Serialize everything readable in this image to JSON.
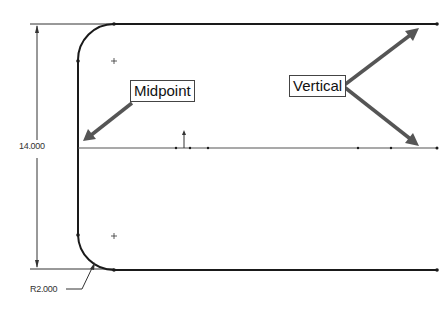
{
  "sketch": {
    "dimensions": {
      "height": "14.000",
      "radius": "R2.000"
    },
    "callouts": [
      {
        "label": "Midpoint"
      },
      {
        "label": "Vertical"
      }
    ]
  },
  "colors": {
    "geometry": "#222222",
    "arrow": "#555555",
    "centerline": "#666666"
  }
}
